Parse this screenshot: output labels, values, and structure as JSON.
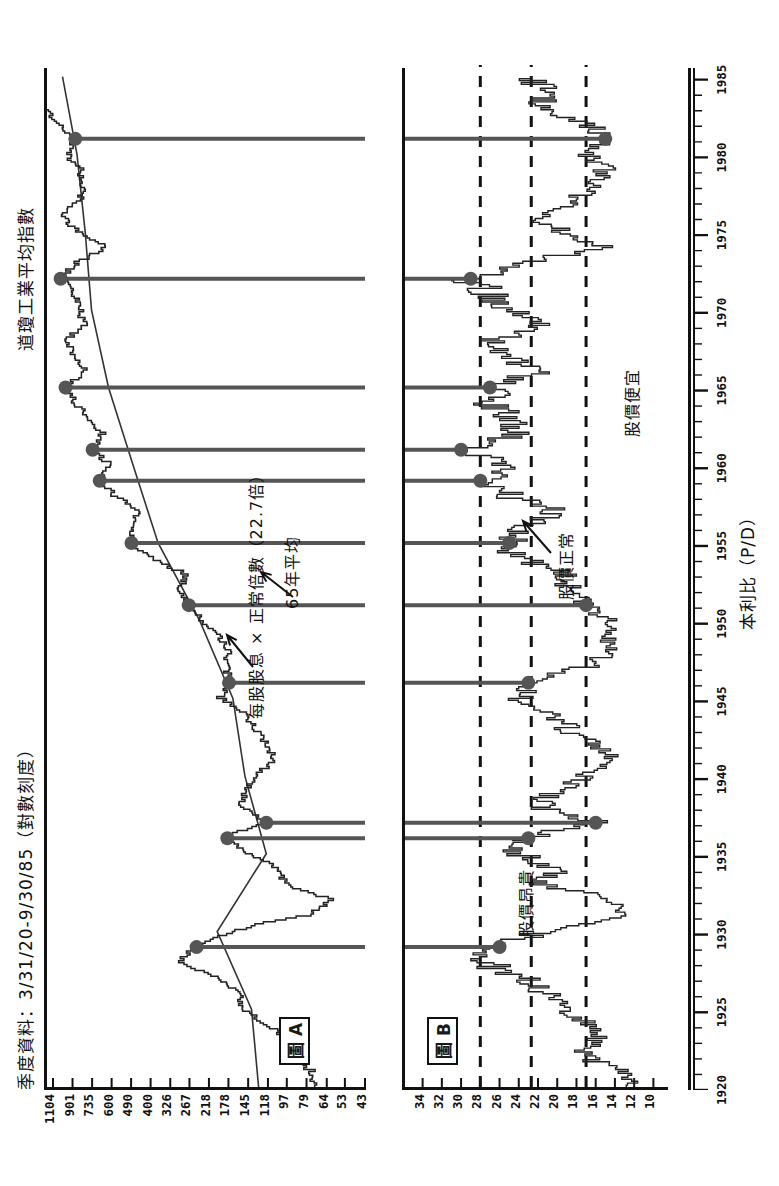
{
  "figure": {
    "header_title": "季度資料：3/31/20-9/30/85（對數刻度）",
    "left_title": "道瓊工業平均指數",
    "xaxis_label": "本利比（P/D）"
  },
  "panelA": {
    "tag": "圖 A",
    "annotation_dividend": "每股股息 × 正常倍數（22.7倍）",
    "annotation_average": "65年平均"
  },
  "panelB": {
    "tag": "圖 B",
    "annotation_expensive": "股價昂貴",
    "annotation_normal": "股價正常",
    "annotation_cheap": "股價便宜"
  },
  "chart_data": [
    {
      "type": "line",
      "id": "panel-A",
      "title": "道瓊工業平均指數",
      "subtitle": "季度資料：3/31/20-9/30/85（對數刻度）",
      "xlabel": "",
      "ylabel": "道瓊工業平均指數",
      "yscale": "log",
      "ytick_labels": [
        "1104",
        "901",
        "735",
        "600",
        "490",
        "400",
        "326",
        "267",
        "218",
        "178",
        "145",
        "118",
        "97",
        "79",
        "64",
        "53",
        "43"
      ],
      "ytick_values": [
        1104,
        901,
        735,
        600,
        490,
        400,
        326,
        267,
        218,
        178,
        145,
        118,
        97,
        79,
        64,
        53,
        43
      ],
      "ylim": [
        43,
        1104
      ],
      "xtick_labels": [
        "1920",
        "1925",
        "1930",
        "1935",
        "1940",
        "1945",
        "1950",
        "1955",
        "1960",
        "1965",
        "1970",
        "1975",
        "1980",
        "1985"
      ],
      "xlim": [
        1920,
        1985.75
      ],
      "grid": false,
      "legend": null,
      "series": [
        {
          "name": "道瓊工業平均指數（季度收盤）",
          "x": [
            1920,
            1921,
            1922,
            1923,
            1924,
            1925,
            1926,
            1927,
            1928,
            1929,
            1930,
            1931,
            1932,
            1933,
            1934,
            1935,
            1936,
            1937,
            1938,
            1939,
            1940,
            1941,
            1942,
            1943,
            1944,
            1945,
            1946,
            1947,
            1948,
            1949,
            1950,
            1951,
            1952,
            1953,
            1954,
            1955,
            1956,
            1957,
            1958,
            1959,
            1960,
            1961,
            1962,
            1963,
            1964,
            1965,
            1966,
            1967,
            1968,
            1969,
            1970,
            1971,
            1972,
            1973,
            1974,
            1975,
            1976,
            1977,
            1978,
            1979,
            1980,
            1981,
            1982,
            1983,
            1984,
            1985
          ],
          "values": [
            72,
            75,
            99,
            96,
            120,
            156,
            157,
            200,
            300,
            248,
            165,
            77,
            60,
            99,
            104,
            144,
            180,
            120,
            155,
            150,
            131,
            111,
            119,
            136,
            152,
            193,
            177,
            181,
            177,
            200,
            235,
            269,
            292,
            281,
            404,
            488,
            499,
            436,
            584,
            679,
            616,
            731,
            652,
            763,
            874,
            969,
            786,
            905,
            944,
            800,
            839,
            890,
            1020,
            851,
            616,
            852,
            1005,
            831,
            805,
            838,
            964,
            875,
            1047,
            1259,
            1212,
            1329
          ]
        },
        {
          "name": "每股股息 × 正常倍數（22.7倍）",
          "x": [
            1920,
            1925,
            1930,
            1935,
            1940,
            1945,
            1950,
            1955,
            1960,
            1965,
            1970,
            1975,
            1980,
            1985
          ],
          "values": [
            130,
            140,
            200,
            120,
            150,
            170,
            240,
            370,
            480,
            620,
            740,
            790,
            860,
            1000
          ]
        }
      ],
      "callouts": [
        {
          "label": "每股股息 × 正常倍數（22.7倍）",
          "points_to_year": 1962
        },
        {
          "label": "65年平均",
          "points_to_year": 1958
        }
      ]
    },
    {
      "type": "line",
      "id": "panel-B",
      "title": "本利比（P/D）",
      "ylabel": "本利比（P/D）",
      "yscale": "linear",
      "ytick_labels": [
        "34",
        "32",
        "30",
        "28",
        "26",
        "24",
        "22",
        "20",
        "18",
        "16",
        "14",
        "12",
        "10"
      ],
      "ytick_values": [
        34,
        32,
        30,
        28,
        26,
        24,
        22,
        20,
        18,
        16,
        14,
        12,
        10
      ],
      "ylim": [
        9,
        35
      ],
      "xtick_labels": [
        "1920",
        "1925",
        "1930",
        "1935",
        "1940",
        "1945",
        "1950",
        "1955",
        "1960",
        "1965",
        "1970",
        "1975",
        "1980",
        "1985"
      ],
      "xlim": [
        1920,
        1985.75
      ],
      "grid": false,
      "reference_lines": [
        {
          "value": 28,
          "style": "dashed",
          "label": "股價昂貴"
        },
        {
          "value": 22.7,
          "style": "dashed",
          "label": "股價正常"
        },
        {
          "value": 17,
          "style": "dashed",
          "label": "股價便宜"
        }
      ],
      "series": [
        {
          "name": "本利比 P/D",
          "x": [
            1920,
            1921,
            1922,
            1923,
            1924,
            1925,
            1926,
            1927,
            1928,
            1929,
            1930,
            1931,
            1932,
            1933,
            1934,
            1935,
            1936,
            1937,
            1938,
            1939,
            1940,
            1941,
            1942,
            1943,
            1944,
            1945,
            1946,
            1947,
            1948,
            1949,
            1950,
            1951,
            1952,
            1953,
            1954,
            1955,
            1956,
            1957,
            1958,
            1959,
            1960,
            1961,
            1962,
            1963,
            1964,
            1965,
            1966,
            1967,
            1968,
            1969,
            1970,
            1971,
            1972,
            1973,
            1974,
            1975,
            1976,
            1977,
            1978,
            1979,
            1980,
            1981,
            1982,
            1983,
            1984,
            1985
          ],
          "values": [
            12,
            13,
            18,
            16,
            17,
            20,
            21,
            24,
            28,
            26,
            21,
            13,
            14,
            22,
            20,
            24,
            23,
            16,
            22,
            20,
            17,
            14,
            16,
            19,
            20,
            24,
            23,
            17,
            14,
            15,
            15,
            17,
            19,
            19,
            24,
            25,
            24,
            20,
            25,
            28,
            25,
            30,
            24,
            25,
            27,
            27,
            22,
            25,
            26,
            22,
            25,
            27,
            29,
            23,
            15,
            20,
            22,
            18,
            16,
            15,
            17,
            15,
            17,
            22,
            21,
            23
          ]
        }
      ],
      "callouts": [
        {
          "label": "股價昂貴",
          "near_year": 1947
        },
        {
          "label": "股價正常",
          "near_year": 1960
        },
        {
          "label": "股價便宜",
          "near_year": 1966
        }
      ]
    }
  ],
  "markers": {
    "description": "配對的圓點連線（圖A高點 ↔ 圖B高點）",
    "pairs": [
      {
        "year": 1929
      },
      {
        "year": 1936
      },
      {
        "year": 1937
      },
      {
        "year": 1946
      },
      {
        "year": 1951
      },
      {
        "year": 1955
      },
      {
        "year": 1959
      },
      {
        "year": 1961
      },
      {
        "year": 1965
      },
      {
        "year": 1972
      },
      {
        "year": 1981
      }
    ]
  }
}
